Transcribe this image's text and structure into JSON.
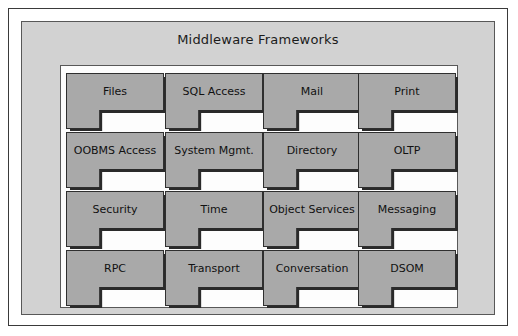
{
  "diagram": {
    "title": "Middleware Frameworks",
    "colors": {
      "page_background": "#ffffff",
      "outer_panel": "#d2d2d2",
      "inner_panel": "#fdfdfd",
      "block_fill": "#a9a9a9",
      "block_outline": "#2f2f2f",
      "block_shadow": "#2a2a2a",
      "text": "#111111"
    },
    "grid": {
      "rows": 4,
      "columns": 4
    },
    "blocks": [
      {
        "label": "Files",
        "row": 0,
        "col": 0
      },
      {
        "label": "SQL Access",
        "row": 0,
        "col": 1
      },
      {
        "label": "Mail",
        "row": 0,
        "col": 2
      },
      {
        "label": "Print",
        "row": 0,
        "col": 3
      },
      {
        "label": "OOBMS Access",
        "row": 1,
        "col": 0
      },
      {
        "label": "System Mgmt.",
        "row": 1,
        "col": 1
      },
      {
        "label": "Directory",
        "row": 1,
        "col": 2
      },
      {
        "label": "OLTP",
        "row": 1,
        "col": 3
      },
      {
        "label": "Security",
        "row": 2,
        "col": 0
      },
      {
        "label": "Time",
        "row": 2,
        "col": 1
      },
      {
        "label": "Object Services",
        "row": 2,
        "col": 2
      },
      {
        "label": "Messaging",
        "row": 2,
        "col": 3
      },
      {
        "label": "RPC",
        "row": 3,
        "col": 0
      },
      {
        "label": "Transport",
        "row": 3,
        "col": 1
      },
      {
        "label": "Conversation",
        "row": 3,
        "col": 2
      },
      {
        "label": "DSOM",
        "row": 3,
        "col": 3
      }
    ]
  }
}
